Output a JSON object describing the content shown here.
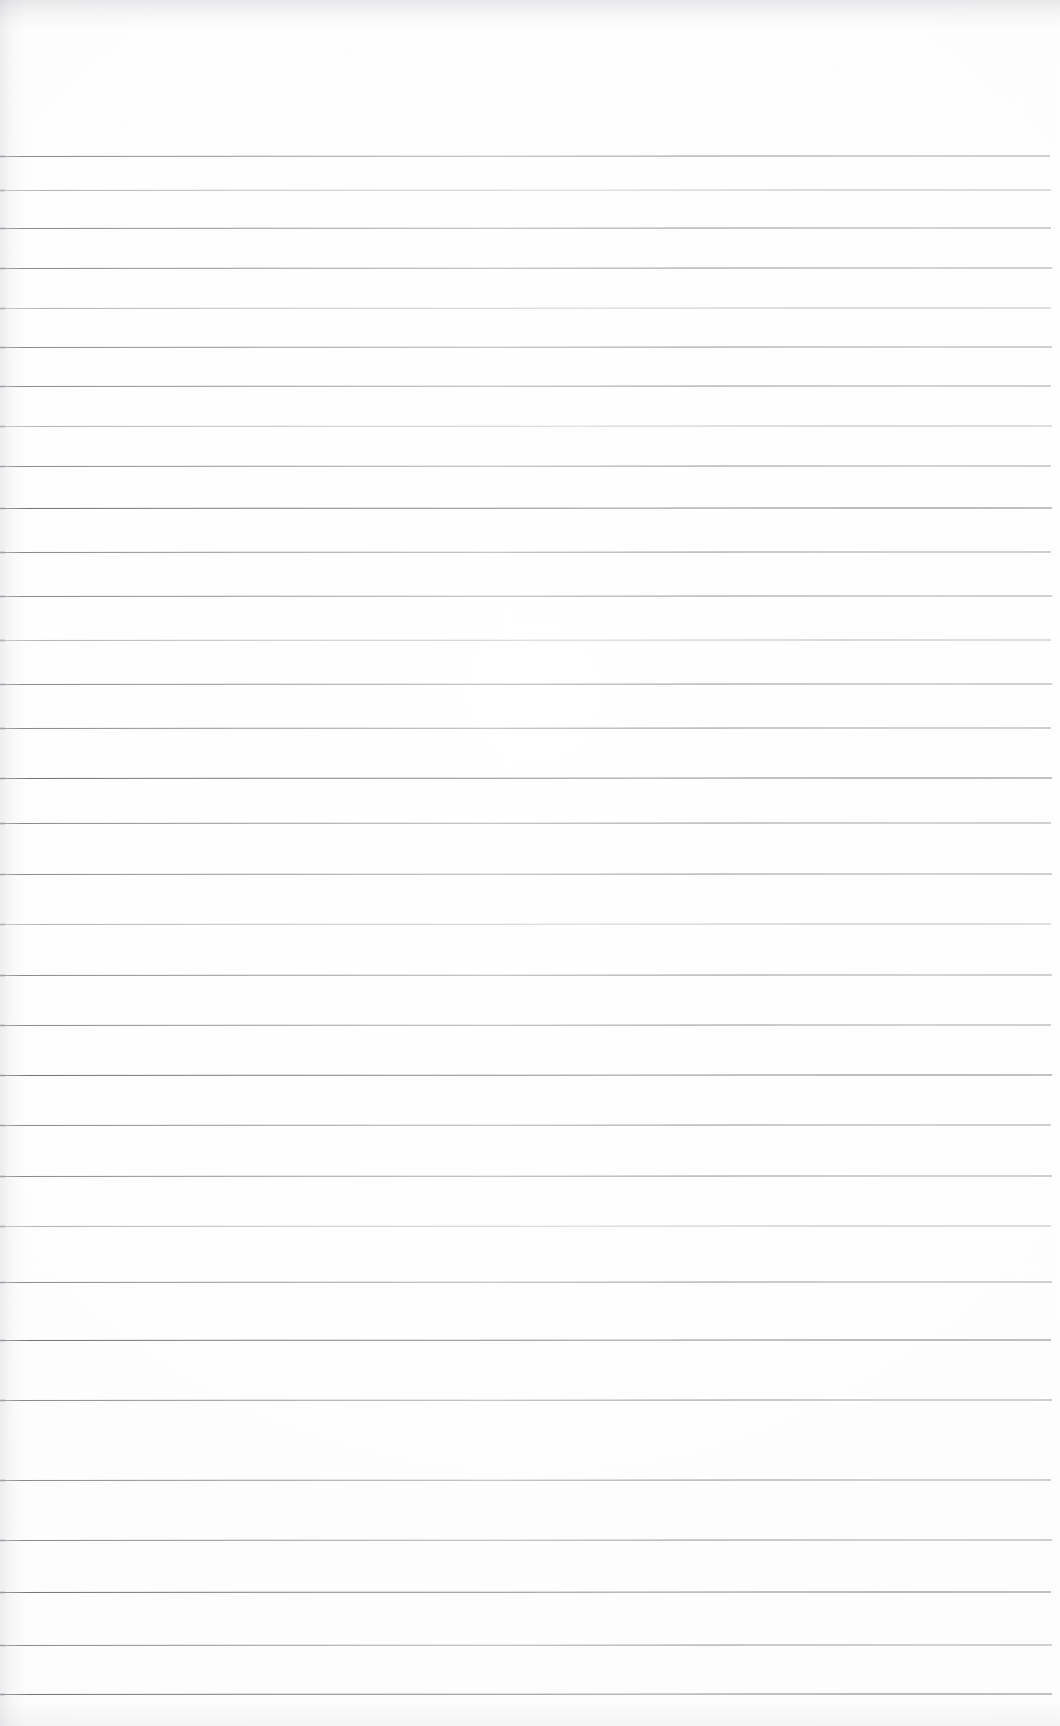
{
  "document": {
    "kind": "scanned-ruled-paper",
    "title": "Blank Lined Notebook Page",
    "orientation": "portrait",
    "width_px": 1060,
    "height_px": 1726,
    "has_text_content": false,
    "has_handwriting": false,
    "has_margin_rule": false,
    "has_header_text": false,
    "has_page_number": false
  },
  "paper": {
    "background_color": "#fdfdfd",
    "edge_shadow_color": "#96999f",
    "grain_color": "#afb2b9"
  },
  "ruling": {
    "line_color": "#8b8e96",
    "line_color_dark": "#6e7178",
    "line_color_faded": "#a6a9b1",
    "line_thickness_px": 1,
    "line_count": 31,
    "first_line_y": 156,
    "line_spacing_px": 50.6,
    "line_start_x": 0,
    "line_end_x": 1052,
    "header_blank_height_px": 156,
    "footer_blank_height_px": 32,
    "lines": [
      {
        "index": 1,
        "y": 156,
        "x_start": 0,
        "x_end": 1050,
        "weight": "normal"
      },
      {
        "index": 2,
        "y": 190,
        "x_start": 0,
        "x_end": 1051,
        "weight": "faded"
      },
      {
        "index": 3,
        "y": 228,
        "x_start": 0,
        "x_end": 1051,
        "weight": "normal"
      },
      {
        "index": 4,
        "y": 268,
        "x_start": 0,
        "x_end": 1052,
        "weight": "normal"
      },
      {
        "index": 5,
        "y": 308,
        "x_start": 0,
        "x_end": 1051,
        "weight": "faded"
      },
      {
        "index": 6,
        "y": 347,
        "x_start": 0,
        "x_end": 1052,
        "weight": "normal"
      },
      {
        "index": 7,
        "y": 386,
        "x_start": 0,
        "x_end": 1051,
        "weight": "normal"
      },
      {
        "index": 8,
        "y": 426,
        "x_start": 0,
        "x_end": 1052,
        "weight": "faded"
      },
      {
        "index": 9,
        "y": 466,
        "x_start": 0,
        "x_end": 1051,
        "weight": "normal"
      },
      {
        "index": 10,
        "y": 508,
        "x_start": 0,
        "x_end": 1052,
        "weight": "dark"
      },
      {
        "index": 11,
        "y": 552,
        "x_start": 0,
        "x_end": 1051,
        "weight": "normal"
      },
      {
        "index": 12,
        "y": 596,
        "x_start": 0,
        "x_end": 1052,
        "weight": "normal"
      },
      {
        "index": 13,
        "y": 640,
        "x_start": 0,
        "x_end": 1051,
        "weight": "faded"
      },
      {
        "index": 14,
        "y": 684,
        "x_start": 0,
        "x_end": 1052,
        "weight": "normal"
      },
      {
        "index": 15,
        "y": 728,
        "x_start": 0,
        "x_end": 1051,
        "weight": "normal"
      },
      {
        "index": 16,
        "y": 778,
        "x_start": 0,
        "x_end": 1052,
        "weight": "dark"
      },
      {
        "index": 17,
        "y": 823,
        "x_start": 0,
        "x_end": 1051,
        "weight": "normal"
      },
      {
        "index": 18,
        "y": 874,
        "x_start": 0,
        "x_end": 1052,
        "weight": "normal"
      },
      {
        "index": 19,
        "y": 924,
        "x_start": 0,
        "x_end": 1051,
        "weight": "faded"
      },
      {
        "index": 20,
        "y": 975,
        "x_start": 0,
        "x_end": 1052,
        "weight": "normal"
      },
      {
        "index": 21,
        "y": 1025,
        "x_start": 0,
        "x_end": 1051,
        "weight": "normal"
      },
      {
        "index": 22,
        "y": 1075,
        "x_start": 0,
        "x_end": 1052,
        "weight": "dark"
      },
      {
        "index": 23,
        "y": 1125,
        "x_start": 0,
        "x_end": 1051,
        "weight": "normal"
      },
      {
        "index": 24,
        "y": 1176,
        "x_start": 0,
        "x_end": 1052,
        "weight": "normal"
      },
      {
        "index": 25,
        "y": 1226,
        "x_start": 0,
        "x_end": 1051,
        "weight": "faded"
      },
      {
        "index": 26,
        "y": 1282,
        "x_start": 0,
        "x_end": 1052,
        "weight": "normal"
      },
      {
        "index": 27,
        "y": 1340,
        "x_start": 0,
        "x_end": 1051,
        "weight": "dark"
      },
      {
        "index": 28,
        "y": 1400,
        "x_start": 0,
        "x_end": 1052,
        "weight": "normal"
      },
      {
        "index": 29,
        "y": 1480,
        "x_start": 0,
        "x_end": 1051,
        "weight": "normal"
      },
      {
        "index": 30,
        "y": 1540,
        "x_start": 0,
        "x_end": 1052,
        "weight": "normal"
      },
      {
        "index": 31,
        "y": 1592,
        "x_start": 0,
        "x_end": 1051,
        "weight": "dark"
      },
      {
        "index": 32,
        "y": 1645,
        "x_start": 0,
        "x_end": 1052,
        "weight": "normal"
      },
      {
        "index": 33,
        "y": 1694,
        "x_start": 0,
        "x_end": 1052,
        "weight": "dark"
      }
    ]
  }
}
